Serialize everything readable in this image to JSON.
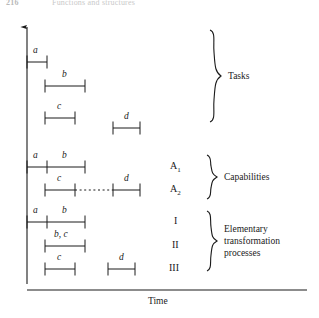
{
  "header": {
    "page_number": "216",
    "running_title": "Functions and structures"
  },
  "axis": {
    "x_label": "Time",
    "y_arrow": "up-arrow"
  },
  "groups": [
    {
      "key": "tasks",
      "label": "Tasks"
    },
    {
      "key": "capabilities",
      "label": "Capabilities"
    },
    {
      "key": "elementary",
      "label": "Elementary\ntransformation\nprocesses",
      "line1": "Elementary",
      "line2": "transformation",
      "line3": "processes"
    }
  ],
  "rows": [
    {
      "group": "tasks",
      "row_label": "",
      "bars": [
        {
          "label": "a"
        }
      ]
    },
    {
      "group": "tasks",
      "row_label": "",
      "bars": [
        {
          "label": "b"
        }
      ]
    },
    {
      "group": "tasks",
      "row_label": "",
      "bars": [
        {
          "label": "c"
        },
        {
          "label": "d"
        }
      ]
    },
    {
      "group": "capabilities",
      "row_label": "A",
      "row_sub": "1",
      "bars": [
        {
          "label": "a"
        },
        {
          "label": "b"
        }
      ]
    },
    {
      "group": "capabilities",
      "row_label": "A",
      "row_sub": "2",
      "bars": [
        {
          "label": "c"
        },
        {
          "label": "d"
        }
      ],
      "connector": "dotted"
    },
    {
      "group": "elementary",
      "row_label": "I",
      "bars": [
        {
          "label": "a"
        },
        {
          "label": "b"
        }
      ]
    },
    {
      "group": "elementary",
      "row_label": "II",
      "bars": [
        {
          "label": "b, c"
        }
      ]
    },
    {
      "group": "elementary",
      "row_label": "III",
      "bars": [
        {
          "label": "c"
        },
        {
          "label": "d"
        }
      ]
    }
  ],
  "bar_labels": {
    "t_a": "a",
    "t_b": "b",
    "t_c": "c",
    "t_d": "d",
    "c1_a": "a",
    "c1_b": "b",
    "c2_c": "c",
    "c2_d": "d",
    "e1_a": "a",
    "e1_b": "b",
    "e2_bc": "b, c",
    "e3_c": "c",
    "e3_d": "d"
  },
  "row_labels": {
    "a1_base": "A",
    "a1_sub": "1",
    "a2_base": "A",
    "a2_sub": "2",
    "r1": "I",
    "r2": "II",
    "r3": "III"
  },
  "group_labels": {
    "tasks": "Tasks",
    "capabilities": "Capabilities",
    "elem_l1": "Elementary",
    "elem_l2": "transformation",
    "elem_l3": "processes"
  },
  "colors": {
    "ink": "#1a1a1a",
    "background": "#ffffff",
    "header_grey": "#c4c4c4"
  }
}
